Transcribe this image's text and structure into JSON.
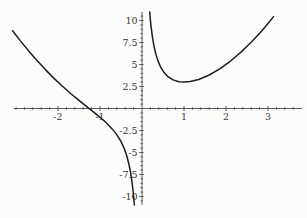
{
  "colors": {
    "background": "#fcfcfb",
    "curve": "#1e1e1e",
    "axis": "#4a4a4a",
    "tick": "#4a4a4a",
    "label": "#383838"
  },
  "chart_data": {
    "type": "line",
    "title": "",
    "xlabel": "",
    "ylabel": "",
    "grid": false,
    "legend": "none",
    "axes_cross_at": [
      0,
      0
    ],
    "xlim": [
      -3.05,
      3.81
    ],
    "ylim": [
      -10.97,
      10.97
    ],
    "x_ticks": {
      "major": [
        -2,
        -1,
        1,
        2,
        3
      ],
      "labels": [
        "-2",
        "-1",
        "1",
        "2",
        "3"
      ],
      "minor_step": 0.2,
      "minor_range": [
        -3.0,
        3.6
      ]
    },
    "y_ticks": {
      "major": [
        10,
        7.5,
        5,
        2.5,
        -2.5,
        -5,
        -7.5,
        -10
      ],
      "labels": [
        "10",
        "7.5",
        "5",
        "2.5",
        "-2.5",
        "-5",
        "-7.5",
        "-10"
      ],
      "minor_step": 0.5,
      "minor_range": [
        -10.5,
        10.5
      ]
    },
    "series": [
      {
        "name": "left-branch",
        "points": [
          [
            -3.08,
            8.84
          ],
          [
            -2.9,
            7.72
          ],
          [
            -2.7,
            6.55
          ],
          [
            -2.5,
            5.45
          ],
          [
            -2.3,
            4.42
          ],
          [
            -2.1,
            3.46
          ],
          [
            -1.9,
            2.56
          ],
          [
            -1.7,
            1.71
          ],
          [
            -1.5,
            0.92
          ],
          [
            -1.3,
            0.15
          ],
          [
            -1.15,
            -0.42
          ],
          [
            -1.0,
            -1.0
          ],
          [
            -0.85,
            -1.63
          ],
          [
            -0.7,
            -2.37
          ],
          [
            -0.6,
            -2.97
          ],
          [
            -0.5,
            -3.75
          ],
          [
            -0.42,
            -4.59
          ],
          [
            -0.36,
            -5.43
          ],
          [
            -0.31,
            -6.36
          ],
          [
            -0.27,
            -7.33
          ],
          [
            -0.24,
            -8.28
          ],
          [
            -0.215,
            -9.26
          ],
          [
            -0.197,
            -10.11
          ],
          [
            -0.185,
            -10.78
          ],
          [
            -0.182,
            -10.96
          ]
        ]
      },
      {
        "name": "right-branch",
        "points": [
          [
            0.183,
            10.96
          ],
          [
            0.19,
            10.56
          ],
          [
            0.2,
            10.04
          ],
          [
            0.215,
            9.35
          ],
          [
            0.235,
            8.57
          ],
          [
            0.26,
            7.76
          ],
          [
            0.29,
            6.98
          ],
          [
            0.33,
            6.17
          ],
          [
            0.38,
            5.41
          ],
          [
            0.44,
            4.74
          ],
          [
            0.52,
            4.12
          ],
          [
            0.62,
            3.61
          ],
          [
            0.74,
            3.25
          ],
          [
            0.88,
            3.05
          ],
          [
            1.0,
            3.0
          ],
          [
            1.15,
            3.06
          ],
          [
            1.35,
            3.3
          ],
          [
            1.6,
            3.81
          ],
          [
            1.85,
            4.5
          ],
          [
            2.1,
            5.36
          ],
          [
            2.35,
            6.37
          ],
          [
            2.6,
            7.53
          ],
          [
            2.85,
            8.82
          ],
          [
            3.0,
            9.67
          ],
          [
            3.13,
            10.44
          ]
        ]
      }
    ]
  }
}
